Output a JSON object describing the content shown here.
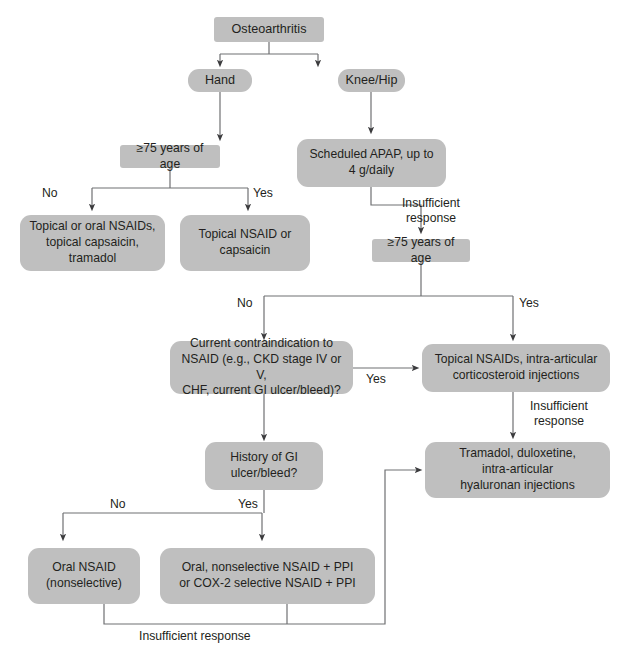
{
  "diagram": {
    "box_fill": "#bfbfbf",
    "text_color": "#231f20",
    "line_color": "#6f7072",
    "nodes": {
      "root": "Osteoarthritis",
      "hand": "Hand",
      "knee_hip": "Knee/Hip",
      "age_hand": "≥75 years of age",
      "apap": "Scheduled APAP, up to\n4 g/daily",
      "hand_no_treat": "Topical or oral NSAIDs,\ntopical capsaicin,\ntramadol",
      "hand_yes_treat": "Topical NSAID or\ncapsaicin",
      "age_knee": "≥75 years of age",
      "contraindication": "Current contraindication to\nNSAID (e.g., CKD stage IV or V,\nCHF, current GI ulcer/bleed)?",
      "topical_inj": "Topical NSAIDs, intra-articular\ncorticosteroid injections",
      "gi_history": "History of GI\nulcer/bleed?",
      "tramadol": "Tramadol, duloxetine,\nintra-articular\nhyaluronan injections",
      "oral_nsaid": "Oral NSAID\n(nonselective)",
      "oral_ppi": "Oral, nonselective NSAID + PPI\nor COX-2 selective NSAID + PPI"
    },
    "edge_labels": {
      "hand_no": "No",
      "hand_yes": "Yes",
      "apap_insufficient": "Insufficient\nresponse",
      "age_knee_no": "No",
      "age_knee_yes": "Yes",
      "contra_yes": "Yes",
      "topical_insufficient": "Insufficient\nresponse",
      "gi_no": "No",
      "gi_yes": "Yes",
      "bottom_insufficient": "Insufficient response"
    }
  }
}
